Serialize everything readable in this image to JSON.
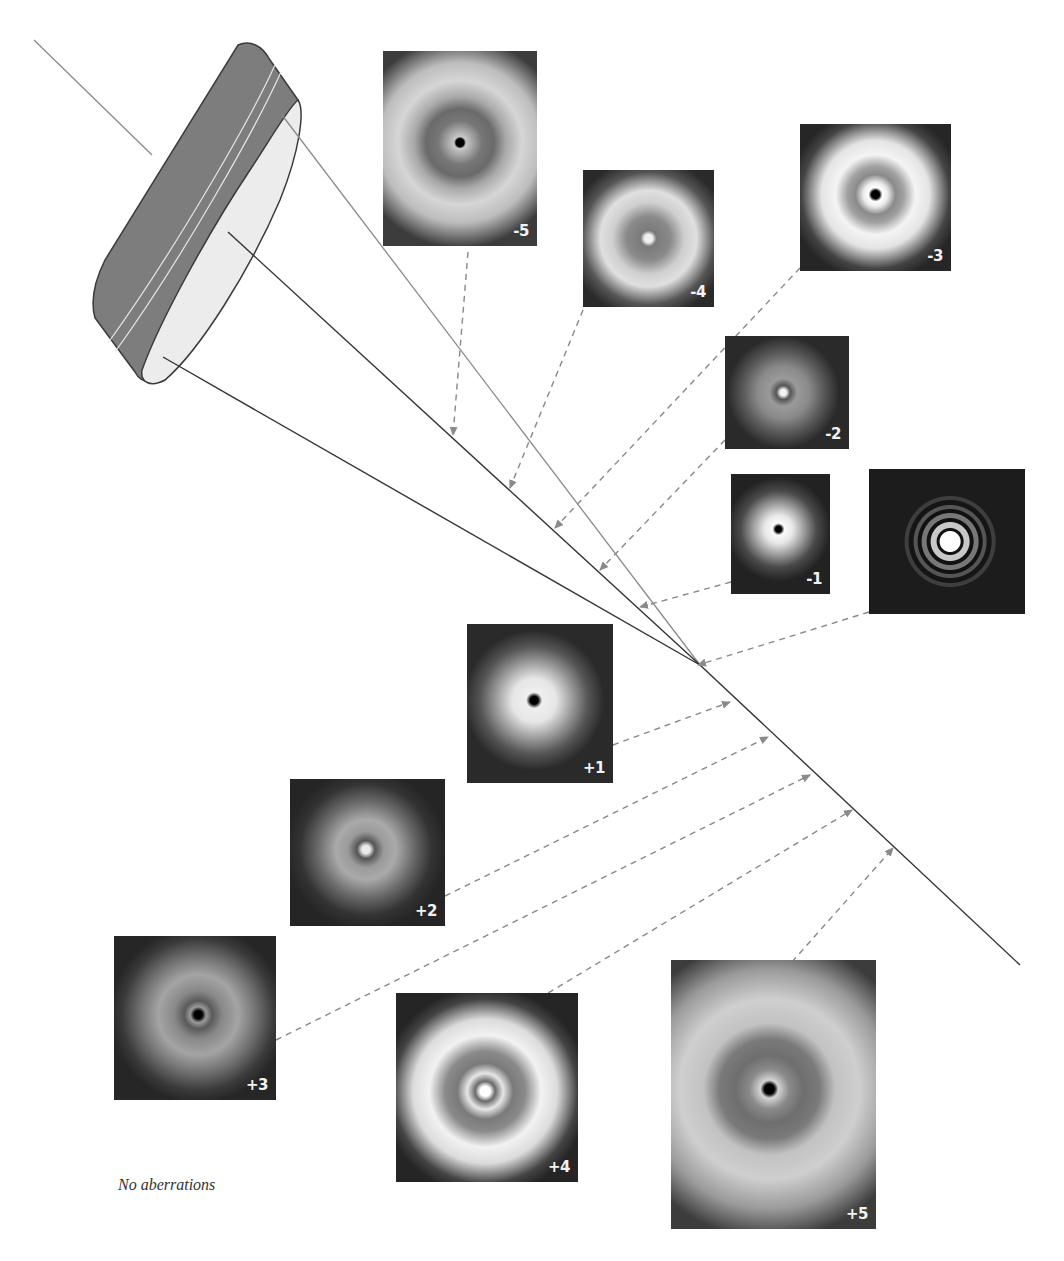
{
  "figure": {
    "caption": "No aberrations",
    "colors": {
      "background": "#ffffff",
      "lens_rim": "#7a7a7a",
      "lens_face": "#e8e8e8",
      "ray": "#333333",
      "chief_ray": "#8a8a8a",
      "dashed_pointer": "#888888",
      "panel_bg": "#1e1e1e",
      "label": "#f2f2f2"
    },
    "panels": [
      {
        "id": "m5",
        "label": "-5"
      },
      {
        "id": "m4",
        "label": "-4"
      },
      {
        "id": "m3",
        "label": "-3"
      },
      {
        "id": "m2",
        "label": "-2"
      },
      {
        "id": "m1",
        "label": "-1"
      },
      {
        "id": "focus",
        "label": ""
      },
      {
        "id": "p1",
        "label": "+1"
      },
      {
        "id": "p2",
        "label": "+2"
      },
      {
        "id": "p3",
        "label": "+3"
      },
      {
        "id": "p4",
        "label": "+4"
      },
      {
        "id": "p5",
        "label": "+5"
      }
    ]
  }
}
